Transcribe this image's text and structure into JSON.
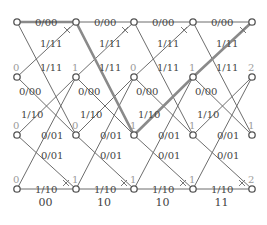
{
  "diagram": {
    "type": "viterbi-trellis",
    "columns_x": [
      17,
      76,
      134,
      193,
      252
    ],
    "rows_y": [
      22,
      77,
      135,
      189
    ],
    "branch_labels": {
      "r0_r0": "0/00",
      "r0_r2": "1/11",
      "r1_r0": "1/11",
      "r1_r2": "0/00",
      "r2_r1": "1/10",
      "r2_r3": "0/01",
      "r3_r1": "0/01",
      "r3_r3": "1/10"
    },
    "metrics": [
      [
        "",
        "0",
        "0",
        "0"
      ],
      [
        "",
        "1",
        "0",
        "1"
      ],
      [
        "",
        "0",
        "1",
        "1"
      ],
      [
        "",
        "1",
        "1",
        "1"
      ],
      [
        "",
        "2",
        "1",
        "2"
      ]
    ],
    "received": [
      "00",
      "10",
      "10",
      "11"
    ],
    "survivor_path": [
      [
        0,
        0
      ],
      [
        1,
        0
      ],
      [
        2,
        2
      ],
      [
        3,
        1
      ],
      [
        4,
        0
      ]
    ],
    "colors": {
      "edge": "#6d6d6d",
      "path": "#8a8a8a",
      "text": "#444444",
      "metric": "#9a9a9a"
    }
  }
}
